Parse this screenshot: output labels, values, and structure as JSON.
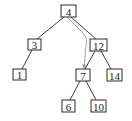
{
  "diagram": {
    "type": "binary-search-tree",
    "nodes": [
      {
        "id": "n4",
        "label": "4",
        "cx": 68,
        "cy": 11,
        "w": 15,
        "h": 12
      },
      {
        "id": "n3",
        "label": "3",
        "cx": 34,
        "cy": 44,
        "w": 13,
        "h": 11
      },
      {
        "id": "n12",
        "label": "12",
        "cx": 98,
        "cy": 45,
        "w": 17,
        "h": 12
      },
      {
        "id": "n1",
        "label": "1",
        "cx": 20,
        "cy": 74,
        "w": 13,
        "h": 11
      },
      {
        "id": "n7",
        "label": "7",
        "cx": 83,
        "cy": 75,
        "w": 14,
        "h": 12
      },
      {
        "id": "n14",
        "label": "14",
        "cx": 114,
        "cy": 75,
        "w": 15,
        "h": 12
      },
      {
        "id": "n6",
        "label": "6",
        "cx": 68,
        "cy": 106,
        "w": 13,
        "h": 12
      },
      {
        "id": "n10",
        "label": "10",
        "cx": 98,
        "cy": 106,
        "w": 15,
        "h": 12
      }
    ],
    "edges": [
      {
        "from": "n4",
        "to": "n3"
      },
      {
        "from": "n4",
        "to": "n12"
      },
      {
        "from": "n3",
        "to": "n1"
      },
      {
        "from": "n12",
        "to": "n7"
      },
      {
        "from": "n12",
        "to": "n14"
      },
      {
        "from": "n7",
        "to": "n6"
      },
      {
        "from": "n7",
        "to": "n10"
      }
    ],
    "highlight_path": {
      "from": "n4",
      "to": "n7",
      "color": "#9a9a9a",
      "style": "curved-arrow"
    }
  }
}
